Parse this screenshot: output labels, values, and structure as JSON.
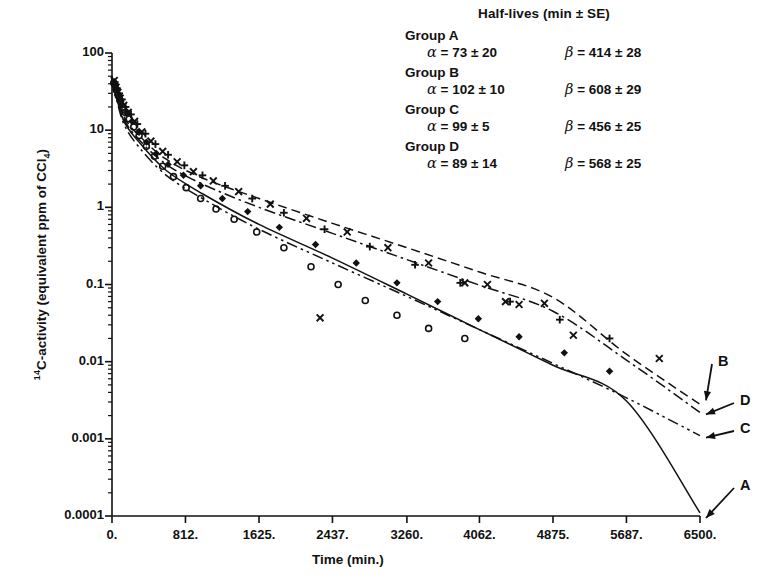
{
  "chart_data": {
    "type": "scatter",
    "title": "",
    "xlabel": "Time (min.)",
    "ylabel": "14C-activity (equivalent ppm of CCl4)",
    "ylabel_parts": {
      "sup": "14",
      "mid": "C-activity (equivalent ppm of CCl",
      "sub": "4",
      "end": ")"
    },
    "xlim": [
      0,
      6500
    ],
    "ylim": [
      0.0001,
      100
    ],
    "yscale": "log",
    "xscale": "linear",
    "grid": false,
    "legend_position": "top-right",
    "xticks": [
      "0.",
      "812.",
      "1625.",
      "2437.",
      "3260.",
      "4062.",
      "4875.",
      "5687.",
      "6500."
    ],
    "xtick_values": [
      0,
      812,
      1625,
      2437,
      3260,
      4062,
      4875,
      5687,
      6500
    ],
    "yticks": [
      "100",
      "10",
      "1",
      "0.1",
      "0.01",
      "0.001",
      "0.0001"
    ],
    "ytick_values": [
      100,
      10,
      1,
      0.1,
      0.01,
      0.001,
      0.0001
    ],
    "series": [
      {
        "name": "A",
        "label": "A",
        "linestyle": "solid",
        "marker": "circle-open",
        "fit_points": [
          [
            0,
            48
          ],
          [
            120,
            14
          ],
          [
            300,
            7.0
          ],
          [
            600,
            3.0
          ],
          [
            1000,
            1.5
          ],
          [
            1625,
            0.6
          ],
          [
            2437,
            0.22
          ],
          [
            3260,
            0.075
          ],
          [
            4062,
            0.026
          ],
          [
            4875,
            0.009
          ],
          [
            5687,
            0.0031
          ],
          [
            6500,
            0.00011
          ]
        ],
        "points": [
          [
            20,
            41
          ],
          [
            35,
            38
          ],
          [
            50,
            33
          ],
          [
            70,
            28
          ],
          [
            95,
            24
          ],
          [
            120,
            20
          ],
          [
            150,
            17
          ],
          [
            190,
            14
          ],
          [
            240,
            11
          ],
          [
            300,
            8.5
          ],
          [
            380,
            6.2
          ],
          [
            470,
            4.6
          ],
          [
            560,
            3.4
          ],
          [
            680,
            2.5
          ],
          [
            820,
            1.8
          ],
          [
            980,
            1.3
          ],
          [
            1150,
            0.95
          ],
          [
            1350,
            0.7
          ],
          [
            1600,
            0.48
          ],
          [
            1900,
            0.3
          ],
          [
            2200,
            0.17
          ],
          [
            2500,
            0.1
          ],
          [
            2800,
            0.062
          ],
          [
            3150,
            0.04
          ],
          [
            3500,
            0.027
          ],
          [
            3900,
            0.02
          ]
        ]
      },
      {
        "name": "B",
        "label": "B",
        "linestyle": "dashed",
        "marker": "cross",
        "fit_points": [
          [
            0,
            50
          ],
          [
            120,
            16
          ],
          [
            300,
            8.5
          ],
          [
            600,
            4.2
          ],
          [
            1000,
            2.4
          ],
          [
            1625,
            1.3
          ],
          [
            2437,
            0.62
          ],
          [
            3260,
            0.3
          ],
          [
            4062,
            0.145
          ],
          [
            4875,
            0.068
          ],
          [
            5687,
            0.0125
          ],
          [
            6500,
            0.0028
          ]
        ],
        "points": [
          [
            25,
            44
          ],
          [
            45,
            36
          ],
          [
            65,
            31
          ],
          [
            90,
            26
          ],
          [
            130,
            21
          ],
          [
            180,
            17
          ],
          [
            250,
            13
          ],
          [
            330,
            9.5
          ],
          [
            430,
            7.2
          ],
          [
            560,
            5.3
          ],
          [
            720,
            3.9
          ],
          [
            900,
            2.9
          ],
          [
            1120,
            2.2
          ],
          [
            1400,
            1.6
          ],
          [
            1750,
            1.1
          ],
          [
            2150,
            0.72
          ],
          [
            2300,
            0.037
          ],
          [
            2600,
            0.48
          ],
          [
            3050,
            0.3
          ],
          [
            3500,
            0.19
          ],
          [
            3900,
            0.105
          ],
          [
            4150,
            0.1
          ],
          [
            4350,
            0.06
          ],
          [
            4500,
            0.055
          ],
          [
            4780,
            0.057
          ],
          [
            5100,
            0.022
          ],
          [
            6050,
            0.011
          ]
        ]
      },
      {
        "name": "C",
        "label": "C",
        "linestyle": "dashdotdot",
        "marker": "diamond",
        "fit_points": [
          [
            0,
            46
          ],
          [
            120,
            13
          ],
          [
            300,
            6.0
          ],
          [
            600,
            2.6
          ],
          [
            1000,
            1.3
          ],
          [
            1625,
            0.52
          ],
          [
            2437,
            0.19
          ],
          [
            3260,
            0.07
          ],
          [
            4062,
            0.026
          ],
          [
            4875,
            0.0095
          ],
          [
            5687,
            0.0034
          ],
          [
            6500,
            0.0011
          ]
        ],
        "points": [
          [
            20,
            40
          ],
          [
            40,
            34
          ],
          [
            60,
            29
          ],
          [
            85,
            25
          ],
          [
            115,
            21
          ],
          [
            160,
            17
          ],
          [
            220,
            13
          ],
          [
            290,
            9.5
          ],
          [
            380,
            7.0
          ],
          [
            490,
            5.0
          ],
          [
            620,
            3.6
          ],
          [
            790,
            2.6
          ],
          [
            980,
            1.9
          ],
          [
            1220,
            1.3
          ],
          [
            1500,
            0.88
          ],
          [
            1850,
            0.55
          ],
          [
            2250,
            0.33
          ],
          [
            2700,
            0.19
          ],
          [
            3150,
            0.105
          ],
          [
            3600,
            0.06
          ],
          [
            4050,
            0.036
          ],
          [
            4500,
            0.021
          ],
          [
            5000,
            0.013
          ],
          [
            5500,
            0.0075
          ]
        ]
      },
      {
        "name": "D",
        "label": "D",
        "linestyle": "dashdot",
        "marker": "plus",
        "fit_points": [
          [
            0,
            49
          ],
          [
            120,
            15
          ],
          [
            300,
            7.5
          ],
          [
            600,
            3.6
          ],
          [
            1000,
            2.0
          ],
          [
            1625,
            1.0
          ],
          [
            2437,
            0.46
          ],
          [
            3260,
            0.21
          ],
          [
            4062,
            0.098
          ],
          [
            4875,
            0.045
          ],
          [
            5687,
            0.0105
          ],
          [
            6500,
            0.0022
          ]
        ],
        "points": [
          [
            30,
            42
          ],
          [
            55,
            35
          ],
          [
            80,
            30
          ],
          [
            110,
            25
          ],
          [
            150,
            20
          ],
          [
            210,
            16
          ],
          [
            280,
            12
          ],
          [
            370,
            9.0
          ],
          [
            480,
            6.6
          ],
          [
            620,
            4.8
          ],
          [
            800,
            3.5
          ],
          [
            1000,
            2.6
          ],
          [
            1250,
            1.9
          ],
          [
            1550,
            1.3
          ],
          [
            1900,
            0.85
          ],
          [
            2350,
            0.52
          ],
          [
            2850,
            0.31
          ],
          [
            3350,
            0.18
          ],
          [
            3850,
            0.105
          ],
          [
            4400,
            0.06
          ],
          [
            4950,
            0.035
          ],
          [
            5500,
            0.02
          ]
        ]
      }
    ],
    "annotations": [
      {
        "label": "B",
        "x": 6500,
        "y": 0.0028
      },
      {
        "label": "D",
        "x": 6500,
        "y": 0.0022
      },
      {
        "label": "C",
        "x": 6500,
        "y": 0.0011
      },
      {
        "label": "A",
        "x": 6500,
        "y": 0.0001
      }
    ]
  },
  "legend": {
    "title": "Half-lives (min ± SE)",
    "groups": [
      {
        "name": "Group A",
        "alpha": "α = 73 ± 20",
        "beta": "β = 414 ± 28"
      },
      {
        "name": "Group B",
        "alpha": "α = 102 ± 10",
        "beta": "β = 608 ± 29"
      },
      {
        "name": "Group C",
        "alpha": "α = 99 ± 5",
        "beta": "β = 456 ± 25"
      },
      {
        "name": "Group D",
        "alpha": "α = 89 ± 14",
        "beta": "β = 568 ± 25"
      }
    ],
    "groups_parts": [
      {
        "name": "Group A",
        "a_sym": "α",
        "a_txt": " = 73 ± 20",
        "b_sym": "β",
        "b_txt": " = 414 ± 28"
      },
      {
        "name": "Group B",
        "a_sym": "α",
        "a_txt": " = 102 ± 10",
        "b_sym": "β",
        "b_txt": " = 608 ± 29"
      },
      {
        "name": "Group C",
        "a_sym": "α",
        "a_txt": " = 99 ± 5",
        "b_sym": "β",
        "b_txt": " = 456 ± 25"
      },
      {
        "name": "Group D",
        "a_sym": "α",
        "a_txt": " = 89 ± 14",
        "b_sym": "β",
        "b_txt": " = 568 ± 25"
      }
    ]
  },
  "colors": {
    "ink": "#111111",
    "background": "#ffffff"
  }
}
